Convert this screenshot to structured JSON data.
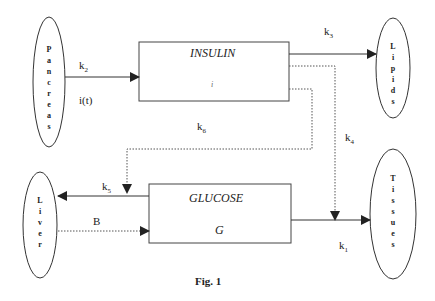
{
  "nodes": {
    "pancreas": "Pancreas",
    "lipids": "Lipids",
    "liver": "Liver",
    "tissues": "Tissues"
  },
  "boxes": {
    "insulin": {
      "title": "INSULIN",
      "symbol": "i"
    },
    "glucose": {
      "title": "GLUCOSE",
      "symbol": "G"
    }
  },
  "edges": {
    "k2": {
      "k": "k",
      "sub": "2"
    },
    "it": "i(t)",
    "k3": {
      "k": "k",
      "sub": "3"
    },
    "k6": {
      "k": "k",
      "sub": "6"
    },
    "k4": {
      "k": "k",
      "sub": "4"
    },
    "k5": {
      "k": "k",
      "sub": "5"
    },
    "B": "B",
    "k1": {
      "k": "k",
      "sub": "1"
    }
  },
  "caption": "Fig. 1"
}
